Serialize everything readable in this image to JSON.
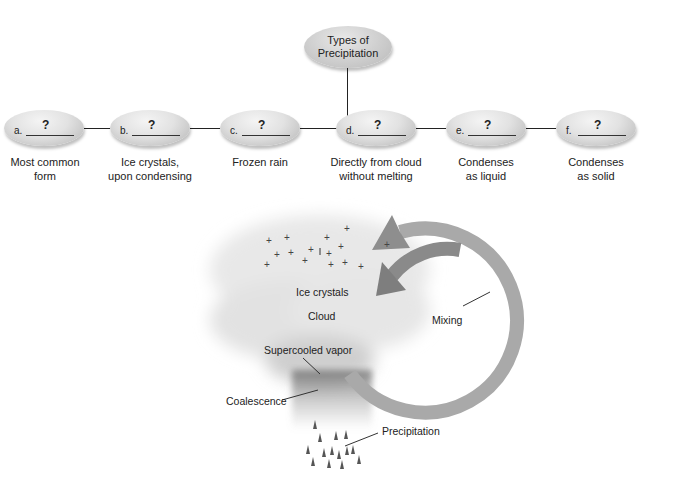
{
  "root": {
    "line1": "Types of",
    "line2": "Precipitation"
  },
  "nodes": [
    {
      "letter": "a.",
      "answer": "?",
      "caption1": "Most common",
      "caption2": "form"
    },
    {
      "letter": "b.",
      "answer": "?",
      "caption1": "Ice crystals,",
      "caption2": "upon condensing"
    },
    {
      "letter": "c.",
      "answer": "?",
      "caption1": "Frozen rain",
      "caption2": ""
    },
    {
      "letter": "d.",
      "answer": "?",
      "caption1": "Directly from cloud",
      "caption2": "without melting"
    },
    {
      "letter": "e.",
      "answer": "?",
      "caption1": "Condenses",
      "caption2": "as liquid"
    },
    {
      "letter": "f.",
      "answer": "?",
      "caption1": "Condenses",
      "caption2": "as solid"
    }
  ],
  "illustration": {
    "labels": {
      "ice_crystals": "Ice crystals",
      "cloud": "Cloud",
      "mixing": "Mixing",
      "supercooled_vapor": "Supercooled vapor",
      "coalescence": "Coalescence",
      "precipitation": "Precipitation"
    },
    "colors": {
      "arrow": "#8a8a8a",
      "cloud": "#e6e6e6",
      "rain": "#8c8c8c"
    }
  }
}
